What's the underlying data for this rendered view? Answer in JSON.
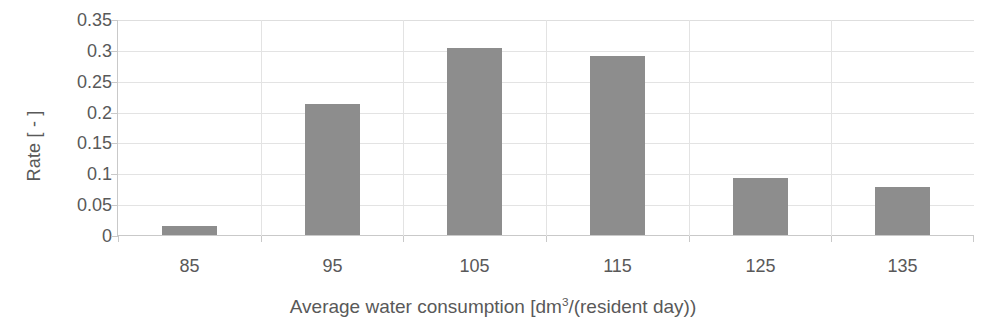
{
  "chart_data": {
    "type": "bar",
    "title": "",
    "categories": [
      "85",
      "95",
      "105",
      "115",
      "125",
      "135"
    ],
    "values": [
      0.015,
      0.212,
      0.303,
      0.29,
      0.092,
      0.078
    ],
    "series": [
      {
        "name": "Rate",
        "values": [
          0.015,
          0.212,
          0.303,
          0.29,
          0.092,
          0.078
        ]
      }
    ],
    "xlabel": "Average water consumption [dm3/(resident day))",
    "xlabel_parts": {
      "before_sup": "Average water consumption [dm",
      "sup": "3",
      "after_sup": "/(resident day))"
    },
    "ylabel": "Rate [ - ]",
    "ylim": [
      0,
      0.35
    ],
    "yticks": [
      0,
      0.05,
      0.1,
      0.15,
      0.2,
      0.25,
      0.3,
      0.35
    ],
    "ytick_labels": [
      "0",
      "0.05",
      "0.1",
      "0.15",
      "0.2",
      "0.25",
      "0.3",
      "0.35"
    ],
    "grid": true,
    "grid_axis": "both",
    "legend": false,
    "legend_position": "none",
    "bar_color": "#8d8d8d",
    "grid_color": "#e3e3e3",
    "axis_color": "#c9c9c9",
    "text_color": "#595959"
  }
}
